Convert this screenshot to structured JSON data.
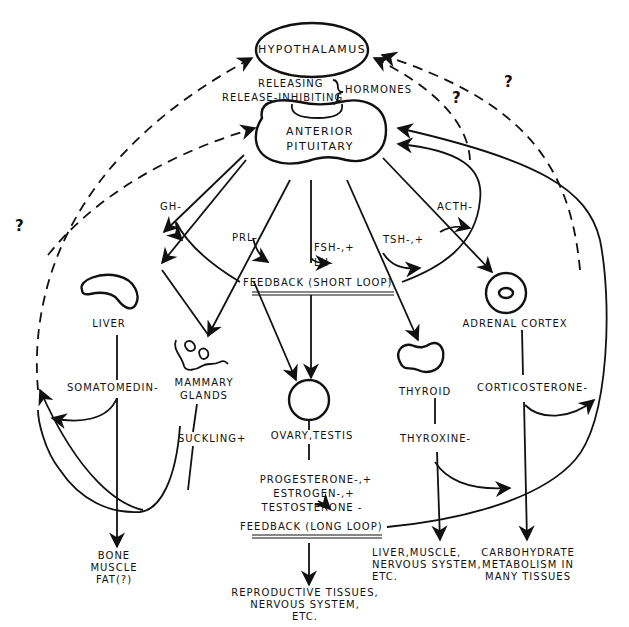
{
  "diagram": {
    "type": "endocrine feedback diagram",
    "nodes": {
      "hypothalamus": "HYPOTHALAMUS",
      "anterior_pituitary": [
        "ANTERIOR",
        "PITUITARY"
      ],
      "liver": "LIVER",
      "mammary_glands": [
        "MAMMARY",
        "GLANDS"
      ],
      "ovary_testis": "OVARY,TESTIS",
      "thyroid": "THYROID",
      "adrenal_cortex": "ADRENAL CORTEX"
    },
    "hypothalamic_hormones": {
      "releasing": "RELEASING",
      "release_inhibiting": "RELEASE-INHIBITING",
      "group_label": "HORMONES"
    },
    "pituitary_hormones": {
      "gh": "GH-",
      "prl": "PRL-",
      "fsh": "FSH-,+",
      "lh": "LH-",
      "tsh": "TSH-,+",
      "acth": "ACTH-"
    },
    "feedback": {
      "short_loop": "FEEDBACK (SHORT LOOP)",
      "long_loop": "FEEDBACK (LONG LOOP)"
    },
    "secondary_hormones": {
      "somatomedin": "SOMATOMEDIN-",
      "suckling": "SUCKLING+",
      "thyroxine": "THYROXINE-",
      "corticosterone": "CORTICOSTERONE-",
      "gonadal": [
        "PROGESTERONE-,+",
        "ESTROGEN-,+",
        "TESTOSTERONE -"
      ]
    },
    "targets": {
      "bone": [
        "BONE",
        "MUSCLE",
        "FAT(?)"
      ],
      "reproductive": [
        "REPRODUCTIVE TISSUES,",
        "NERVOUS SYSTEM,",
        "ETC."
      ],
      "thyroid_targets": [
        "LIVER,MUSCLE,",
        "NERVOUS SYSTEM,",
        "ETC."
      ],
      "adrenal_targets": [
        "CARBOHYDRATE",
        "METABOLISM IN",
        "MANY TISSUES"
      ]
    },
    "uncertain_marks": [
      "?",
      "?",
      "?"
    ],
    "colors": {
      "ink": "#111111",
      "background": "#ffffff"
    }
  }
}
